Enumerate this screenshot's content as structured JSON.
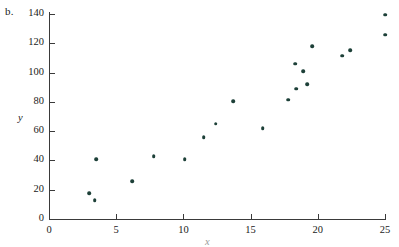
{
  "figure": {
    "panel_label": "b.",
    "axis_color": "#3a3a3a",
    "point_color": "#1d4038"
  },
  "chart_data": {
    "type": "scatter",
    "title": "",
    "subtitle": "",
    "xlabel": "x",
    "ylabel": "y",
    "xlim": [
      0,
      25.8
    ],
    "ylim": [
      0,
      141.5
    ],
    "grid": false,
    "legend": null,
    "xticks": [
      0,
      5,
      10,
      15,
      20,
      25
    ],
    "xtick_labels": [
      "0",
      "5",
      "10",
      "15",
      "20",
      "25"
    ],
    "yticks": [
      0,
      20,
      40,
      60,
      80,
      100,
      120,
      140
    ],
    "ytick_labels": [
      "0",
      "20",
      "40",
      "60",
      "80",
      "100",
      "120",
      "140"
    ],
    "series": [
      {
        "name": "observations",
        "marker": "filled-circle",
        "color": "#1d4038",
        "points": [
          {
            "x": 3.0,
            "y": 17.5
          },
          {
            "x": 3.4,
            "y": 13.0
          },
          {
            "x": 3.5,
            "y": 41.0
          },
          {
            "x": 6.2,
            "y": 26.0
          },
          {
            "x": 7.8,
            "y": 43.0
          },
          {
            "x": 10.1,
            "y": 41.0
          },
          {
            "x": 11.5,
            "y": 56.0
          },
          {
            "x": 12.4,
            "y": 65.0
          },
          {
            "x": 13.7,
            "y": 80.5
          },
          {
            "x": 15.9,
            "y": 62.0
          },
          {
            "x": 17.8,
            "y": 81.5
          },
          {
            "x": 18.3,
            "y": 106.0
          },
          {
            "x": 18.4,
            "y": 89.0
          },
          {
            "x": 18.9,
            "y": 101.0
          },
          {
            "x": 19.2,
            "y": 92.0
          },
          {
            "x": 19.6,
            "y": 118.0
          },
          {
            "x": 21.8,
            "y": 111.5
          },
          {
            "x": 22.4,
            "y": 115.5
          },
          {
            "x": 25.0,
            "y": 126.0
          },
          {
            "x": 25.0,
            "y": 139.5
          }
        ]
      }
    ]
  }
}
